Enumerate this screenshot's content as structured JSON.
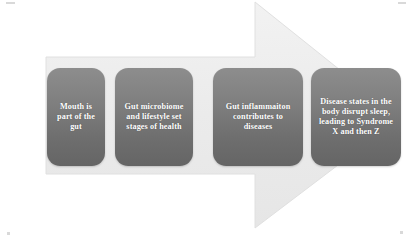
{
  "diagram": {
    "type": "process-arrow-flow",
    "title": "",
    "direction": "left-to-right",
    "background_color": "#ffffff",
    "arrow": {
      "name": "background-arrow",
      "fill_color": "#ececec",
      "edge_color": "#e3e3e3",
      "points": "46,57 255,57 255,2 400,118 255,228 255,174 46,174"
    },
    "steps": [
      {
        "index": 1,
        "text": "Mouth is part of the gut",
        "fill_top_color": "#8d8d8d",
        "fill_bottom_color": "#656565",
        "text_color": "#ffffff"
      },
      {
        "index": 2,
        "text": "Gut microbiome and lifestyle set stages of health",
        "fill_top_color": "#8d8d8d",
        "fill_bottom_color": "#656565",
        "text_color": "#ffffff"
      },
      {
        "index": 3,
        "text": "Gut inflammaiton contributes to diseases",
        "fill_top_color": "#8d8d8d",
        "fill_bottom_color": "#656565",
        "text_color": "#ffffff"
      },
      {
        "index": 4,
        "text": "Disease states in the body disrupt sleep, leading to Syndrome X and then Z",
        "fill_top_color": "#8d8d8d",
        "fill_bottom_color": "#656565",
        "text_color": "#ffffff"
      }
    ]
  }
}
